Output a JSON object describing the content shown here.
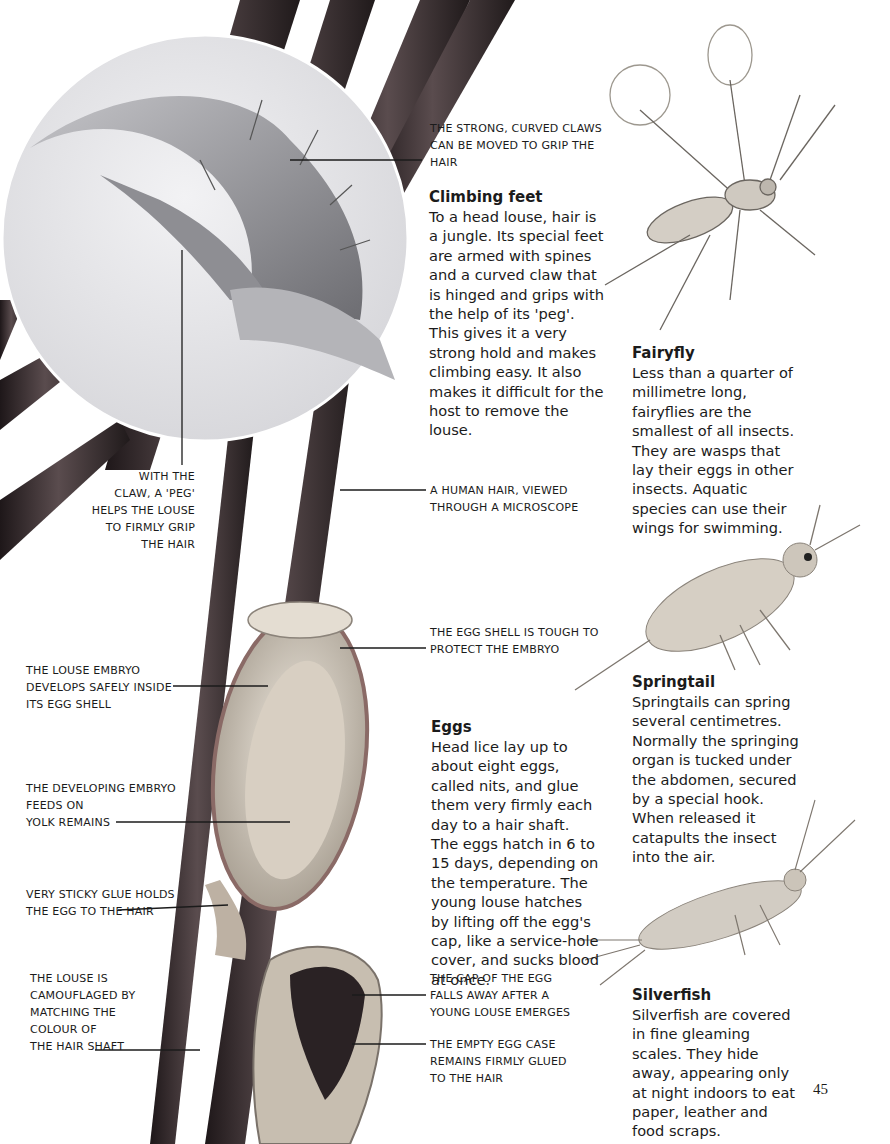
{
  "page": {
    "page_number": "45"
  },
  "callouts": {
    "claws": [
      "The strong, curved claws",
      "can be moved to grip the",
      "hair"
    ],
    "peg": [
      "With the",
      "claw, a 'peg'",
      "helps the louse",
      "to firmly grip",
      "the hair"
    ],
    "human_hair": [
      "A human hair, viewed",
      "through a microscope"
    ],
    "embryo": [
      "The louse embryo",
      "develops safely inside",
      "its egg shell"
    ],
    "egg_shell": [
      "The egg shell is tough to",
      "protect the embryo"
    ],
    "yolk": [
      "The developing embryo",
      "feeds on",
      "yolk remains"
    ],
    "glue": [
      "Very sticky glue holds",
      "the egg to the hair"
    ],
    "camouflage": [
      "The louse is",
      "camouflaged by",
      "matching the",
      "colour of",
      "the hair shaft"
    ],
    "cap_falls": [
      "The cap of the egg",
      "falls away after a",
      "young louse emerges"
    ],
    "empty_case": [
      "The empty egg case",
      "remains firmly glued",
      "to the hair"
    ]
  },
  "sections": {
    "climbing_feet": {
      "title": "Climbing feet",
      "body": "To a head louse, hair is a jungle. Its special feet are armed with spines and a curved claw that is hinged and grips with the help of its 'peg'. This gives it a very strong hold and makes climbing easy. It also makes it difficult for the host to remove the louse."
    },
    "eggs": {
      "title": "Eggs",
      "body": "Head lice lay up to about eight eggs, called nits, and glue them very firmly each day to a hair shaft. The eggs hatch in 6 to 15 days, depending on the temperature. The young louse hatches by lifting off the egg's cap, like a service-hole cover, and sucks blood at once."
    },
    "fairyfly": {
      "title": "Fairyfly",
      "body": "Less than a quarter of millimetre long, fairyflies are the smallest of all insects. They are wasps that lay their eggs in other insects. Aquatic species can use their wings for swimming."
    },
    "springtail": {
      "title": "Springtail",
      "body": "Springtails can spring several centimetres. Normally the springing organ is tucked under the abdomen, secured by a special hook. When released it catapults the insect into the air."
    },
    "silverfish": {
      "title": "Silverfish",
      "body": "Silverfish are covered in fine gleaming scales. They hide away, appearing only at night indoors to eat paper, leather and food scraps."
    }
  },
  "colors": {
    "hair_dark": "#2a2224",
    "hair_mid": "#4a3e40",
    "lens_bg": "#e6e6e8",
    "claw": "#9c9ca0",
    "egg_shell": "#c9c2b6",
    "egg_rim": "#8a6a66",
    "insect": "#cfc9c0",
    "text": "#1b1b1b"
  }
}
